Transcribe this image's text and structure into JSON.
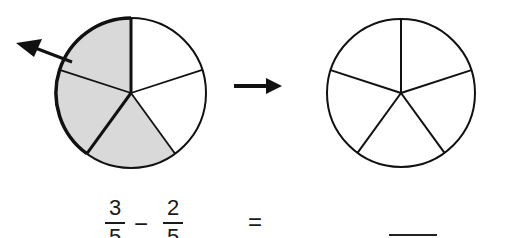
{
  "diagram": {
    "left_pie": {
      "slices": 5,
      "shaded": 3,
      "removed_arrow": "arrow pointing up-left out of shaded region"
    },
    "transition_arrow": "arrow-right",
    "right_pie": {
      "slices": 5,
      "shaded": 0
    },
    "colors": {
      "stroke": "#111111",
      "shade": "#d9d9d9",
      "background": "#ffffff"
    }
  },
  "equation": {
    "frac1": {
      "numerator": "3",
      "denominator": "5"
    },
    "operator": "−",
    "frac2": {
      "numerator": "2",
      "denominator": "5"
    },
    "equals": "=",
    "answer_blank": ""
  }
}
